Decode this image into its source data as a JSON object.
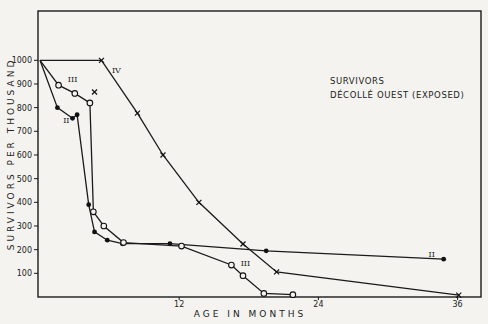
{
  "chart_data": {
    "type": "line",
    "title": "",
    "annotation": [
      "SURVIVORS",
      "DÉCOLLÉ OUEST (EXPOSED)"
    ],
    "xlabel": "AGE IN MONTHS",
    "ylabel": "SURVIVORS PER THOUSAND",
    "xlim": [
      0,
      38
    ],
    "ylim": [
      0,
      1100
    ],
    "x_ticks": [
      12,
      24,
      36
    ],
    "y_ticks": [
      100,
      200,
      300,
      400,
      500,
      600,
      700,
      800,
      900,
      1000
    ],
    "grid": false,
    "legend": "inline curve labels (II, III, IV)",
    "series": [
      {
        "name": "II",
        "marker": "filled-circle",
        "points": [
          [
            0,
            1000
          ],
          [
            1.5,
            800
          ],
          [
            2.8,
            755
          ],
          [
            3.2,
            770
          ],
          [
            4.2,
            390
          ],
          [
            4.7,
            275
          ],
          [
            5.8,
            240
          ],
          [
            7.1,
            225
          ],
          [
            11.2,
            225
          ],
          [
            19.5,
            195
          ],
          [
            34.8,
            160
          ]
        ],
        "label_pos": [
          [
            2.0,
            735
          ],
          [
            33.5,
            170
          ]
        ]
      },
      {
        "name": "III",
        "marker": "open-circle",
        "points": [
          [
            0,
            1000
          ],
          [
            1.6,
            895
          ],
          [
            3.0,
            860
          ],
          [
            4.3,
            820
          ],
          [
            4.6,
            360
          ],
          [
            5.5,
            300
          ],
          [
            7.2,
            230
          ],
          [
            12.2,
            215
          ],
          [
            16.5,
            135
          ],
          [
            17.5,
            90
          ],
          [
            19.3,
            15
          ],
          [
            21.8,
            10
          ]
        ],
        "label_pos": [
          [
            2.4,
            910
          ],
          [
            17.3,
            130
          ]
        ]
      },
      {
        "name": "IV",
        "marker": "cross",
        "points": [
          [
            0,
            1000
          ],
          [
            5.3,
            1000
          ],
          [
            8.4,
            777
          ],
          [
            10.6,
            600
          ],
          [
            13.7,
            400
          ],
          [
            17.5,
            224
          ],
          [
            20.4,
            106
          ],
          [
            36.1,
            8
          ]
        ],
        "extra_points": [
          [
            4.7,
            866
          ]
        ],
        "label_pos": [
          [
            6.2,
            945
          ]
        ]
      }
    ]
  }
}
